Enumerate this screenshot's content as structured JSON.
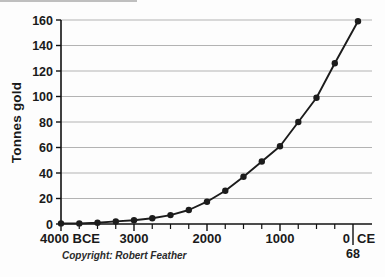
{
  "figure": {
    "copyright": "Copyright: Robert Feather"
  },
  "chart_data": {
    "type": "line",
    "title": "",
    "xlabel": "",
    "ylabel": "Tonnes gold",
    "ylim": [
      0,
      160
    ],
    "yticks": [
      0,
      20,
      40,
      60,
      80,
      100,
      120,
      140,
      160
    ],
    "grid": true,
    "legend": "none",
    "line_color": "#1c1c1c",
    "marker": "filled-circle",
    "grid_color": "#b3b3b3",
    "x_axis": {
      "major_ticks": [
        {
          "label": "4000 BCE",
          "year": 4000,
          "era": "BCE"
        },
        {
          "label": "3000",
          "year": 3000,
          "era": "BCE"
        },
        {
          "label": "2000",
          "year": 2000,
          "era": "BCE"
        },
        {
          "label": "1000",
          "year": 1000,
          "era": "BCE"
        }
      ],
      "zero_tick": {
        "left_label": "0",
        "right_label": "CE",
        "below_label": "68"
      },
      "minor_tick_interval_years": 250
    },
    "points": [
      {
        "year": 4000,
        "era": "BCE",
        "value": 0.5
      },
      {
        "year": 3750,
        "era": "BCE",
        "value": 0.5
      },
      {
        "year": 3500,
        "era": "BCE",
        "value": 1
      },
      {
        "year": 3250,
        "era": "BCE",
        "value": 2
      },
      {
        "year": 3000,
        "era": "BCE",
        "value": 3
      },
      {
        "year": 2750,
        "era": "BCE",
        "value": 4.5
      },
      {
        "year": 2500,
        "era": "BCE",
        "value": 7
      },
      {
        "year": 2250,
        "era": "BCE",
        "value": 11
      },
      {
        "year": 2000,
        "era": "BCE",
        "value": 17.5
      },
      {
        "year": 1750,
        "era": "BCE",
        "value": 26
      },
      {
        "year": 1500,
        "era": "BCE",
        "value": 37
      },
      {
        "year": 1250,
        "era": "BCE",
        "value": 49
      },
      {
        "year": 1000,
        "era": "BCE",
        "value": 61
      },
      {
        "year": 750,
        "era": "BCE",
        "value": 80
      },
      {
        "year": 500,
        "era": "BCE",
        "value": 99
      },
      {
        "year": 250,
        "era": "BCE",
        "value": 126
      },
      {
        "year": 68,
        "era": "CE",
        "value": 159
      }
    ]
  }
}
